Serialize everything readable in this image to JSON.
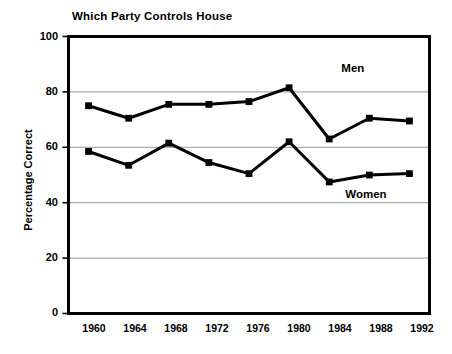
{
  "chart_data": {
    "type": "line",
    "title": "Which Party Controls House",
    "xlabel": "",
    "ylabel": "Percentage Correct",
    "categories": [
      "1960",
      "1964",
      "1968",
      "1972",
      "1976",
      "1980",
      "1984",
      "1988",
      "1992"
    ],
    "x": [
      1960,
      1964,
      1968,
      1972,
      1976,
      1980,
      1984,
      1988,
      1992
    ],
    "series": [
      {
        "name": "Men",
        "values": [
          75,
          70.5,
          75.5,
          75.5,
          76.5,
          81.5,
          63,
          70.5,
          69.5
        ],
        "color": "#000000",
        "marker": "square",
        "label_x": 1987.2,
        "label_y": 88
      },
      {
        "name": "Women",
        "values": [
          58.5,
          53.5,
          61.5,
          54.5,
          50.5,
          62,
          47.5,
          50,
          50.5
        ],
        "color": "#000000",
        "marker": "square",
        "label_x": 1987.6,
        "label_y": 42.5
      }
    ],
    "ylim": [
      0,
      100
    ],
    "yticks": [
      0,
      20,
      40,
      60,
      80,
      100
    ],
    "ytick_labels": [
      "0",
      "20",
      "40",
      "60",
      "80",
      "100"
    ],
    "xlim": [
      1958,
      1994
    ],
    "grid": "horizontal",
    "legend": "inline-annotations",
    "frame": "box"
  },
  "axes": {
    "y_label": "Percentage Correct",
    "y_ticks": [
      "100",
      "80",
      "60",
      "40",
      "20",
      "0"
    ],
    "x_ticks": [
      "1960",
      "1964",
      "1968",
      "1972",
      "1976",
      "1980",
      "1984",
      "1988",
      "1992"
    ]
  },
  "annotations": {
    "men": "Men",
    "women": "Women"
  },
  "colors": {
    "line": "#000000",
    "grid": "#8c8c8c",
    "frame": "#000000",
    "background": "#ffffff"
  }
}
